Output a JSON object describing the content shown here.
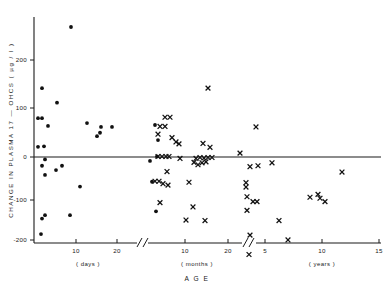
{
  "chart_data": {
    "type": "scatter",
    "title": "",
    "xlabel": "A G E",
    "ylabel": "CHANGE IN PLASMA 17 - OHCS ( µg / l )",
    "ylim": [
      -200,
      290
    ],
    "grid": false,
    "legend_position": "none",
    "y_ticks": [
      200,
      100,
      0,
      -100,
      -200
    ],
    "y_tick_labels": [
      "200",
      "100",
      "0",
      "-100",
      "-200"
    ],
    "x_axis_broken": true,
    "x_break_count": 2,
    "x_segments": [
      {
        "name": "days",
        "unit_label": "( days )",
        "ticks": [
          10,
          20
        ],
        "tick_labels": [
          "10",
          "20"
        ]
      },
      {
        "name": "months",
        "unit_label": "( months )",
        "ticks": [
          10,
          20
        ],
        "tick_labels": [
          "10",
          "20"
        ]
      },
      {
        "name": "years",
        "unit_label": "( years )",
        "ticks": [
          5,
          10,
          15
        ],
        "tick_labels": [
          "5",
          "10",
          "15"
        ]
      }
    ],
    "series": [
      {
        "name": "circle-marker-group",
        "marker": "filled-circle",
        "points": [
          [
            71,
            268
          ],
          [
            42,
            142
          ],
          [
            57,
            112
          ],
          [
            38,
            80
          ],
          [
            42,
            80
          ],
          [
            48,
            64
          ],
          [
            87,
            70
          ],
          [
            101,
            62
          ],
          [
            112,
            62
          ],
          [
            97,
            43
          ],
          [
            100,
            50
          ],
          [
            38,
            21
          ],
          [
            44,
            22
          ],
          [
            45,
            -5
          ],
          [
            42,
            -18
          ],
          [
            45,
            -37
          ],
          [
            56,
            -27
          ],
          [
            62,
            -18
          ],
          [
            80,
            -61
          ],
          [
            42,
            -127
          ],
          [
            45,
            -120
          ],
          [
            70,
            -120
          ],
          [
            41,
            -159
          ],
          [
            155,
            66
          ],
          [
            158,
            35
          ],
          [
            157,
            1
          ],
          [
            150,
            -8
          ],
          [
            152,
            -51
          ],
          [
            156,
            -112
          ]
        ]
      },
      {
        "name": "cross-marker-group",
        "marker": "cross",
        "points": [
          [
            208,
            142
          ],
          [
            165,
            82
          ],
          [
            170,
            82
          ],
          [
            160,
            63
          ],
          [
            165,
            63
          ],
          [
            158,
            47
          ],
          [
            172,
            40
          ],
          [
            176,
            31
          ],
          [
            179,
            27
          ],
          [
            158,
            1
          ],
          [
            162,
            1
          ],
          [
            166,
            1
          ],
          [
            169,
            1
          ],
          [
            180,
            -3
          ],
          [
            167,
            -30
          ],
          [
            155,
            -50
          ],
          [
            159,
            -50
          ],
          [
            163,
            -55
          ],
          [
            168,
            -58
          ],
          [
            160,
            -94
          ],
          [
            203,
            28
          ],
          [
            210,
            20
          ],
          [
            196,
            -3
          ],
          [
            200,
            -1
          ],
          [
            204,
            -2
          ],
          [
            208,
            -1
          ],
          [
            212,
            -1
          ],
          [
            194,
            -11
          ],
          [
            198,
            -16
          ],
          [
            202,
            -12
          ],
          [
            206,
            -10
          ],
          [
            189,
            -52
          ],
          [
            193,
            -103
          ],
          [
            186,
            -130
          ],
          [
            205,
            -131
          ],
          [
            240,
            8
          ],
          [
            256,
            62
          ],
          [
            250,
            -20
          ],
          [
            258,
            -18
          ],
          [
            246,
            -53
          ],
          [
            246,
            -62
          ],
          [
            247,
            -82
          ],
          [
            253,
            -92
          ],
          [
            257,
            -92
          ],
          [
            247,
            -110
          ],
          [
            250,
            -161
          ],
          [
            249,
            -201
          ],
          [
            272,
            -12
          ],
          [
            279,
            -131
          ],
          [
            288,
            -171
          ],
          [
            310,
            -83
          ],
          [
            318,
            -77
          ],
          [
            320,
            -85
          ],
          [
            325,
            -92
          ],
          [
            342,
            -31
          ]
        ]
      }
    ]
  },
  "figure": {
    "y_axis_title": "CHANGE  IN  PLASMA  17  —  OHCS  ( µg / l )",
    "x_axis_title": "A G E",
    "y_tick_labels": [
      "200",
      "100",
      "0",
      "-100",
      "-200"
    ],
    "x_tick_labels_days": [
      "10",
      "20"
    ],
    "x_tick_labels_months": [
      "10",
      "20"
    ],
    "x_tick_labels_years": [
      "5",
      "10",
      "15"
    ],
    "unit_days": "( days )",
    "unit_months": "( months )",
    "unit_years": "( years )",
    "marker_circle": "filled-circle-marker",
    "marker_cross": "cross-marker",
    "ink_color": "#1a1a1a",
    "background_color": "#ffffff"
  }
}
